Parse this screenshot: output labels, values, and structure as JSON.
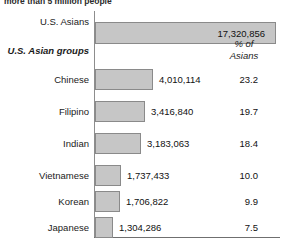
{
  "caption": {
    "text": "more than 5 million people"
  },
  "header": {
    "groups_label": "U.S. Asian groups",
    "pct_line1": "% of",
    "pct_line2": "Asians"
  },
  "total_row": {
    "label": "U.S. Asians",
    "value": "17,320,856"
  },
  "chart_data": {
    "type": "bar",
    "title": "",
    "xlabel": "",
    "ylabel": "",
    "orientation": "horizontal",
    "grid": false,
    "legend": false,
    "total": {
      "category": "U.S. Asians",
      "value": 17320856,
      "value_label": "17,320,856"
    },
    "categories": [
      "Chinese",
      "Filipino",
      "Indian",
      "Vietnamese",
      "Korean",
      "Japanese"
    ],
    "series": [
      {
        "name": "Population",
        "values": [
          4010114,
          3416840,
          3183063,
          1737433,
          1706822,
          1304286
        ],
        "value_labels": [
          "4,010,114",
          "3,416,840",
          "3,183,063",
          "1,737,433",
          "1,706,822",
          "1,304,286"
        ]
      },
      {
        "name": "% of Asians",
        "values": [
          23.2,
          19.7,
          18.4,
          10.0,
          9.9,
          7.5
        ],
        "value_labels": [
          "23.2",
          "19.7",
          "18.4",
          "10.0",
          "9.9",
          "7.5"
        ]
      }
    ]
  },
  "rows": [
    {
      "label": "Chinese",
      "value": "4,010,114",
      "pct": "23.2",
      "bar_px": 58,
      "top": 69
    },
    {
      "label": "Filipino",
      "value": "3,416,840",
      "pct": "19.7",
      "bar_px": 50,
      "top": 101
    },
    {
      "label": "Indian",
      "value": "3,183,063",
      "pct": "18.4",
      "bar_px": 46,
      "top": 133
    },
    {
      "label": "Vietnamese",
      "value": "1,737,433",
      "pct": "10.0",
      "bar_px": 26,
      "top": 165
    },
    {
      "label": "Korean",
      "value": "1,706,822",
      "pct": "9.9",
      "bar_px": 25,
      "top": 191
    },
    {
      "label": "Japanese",
      "value": "1,304,286",
      "pct": "7.5",
      "bar_px": 18,
      "top": 217
    }
  ],
  "colors": {
    "bar_fill": "#c6c6c6",
    "bar_border": "#8a8a8a",
    "axis": "#8d8d8d",
    "text": "#111111"
  }
}
